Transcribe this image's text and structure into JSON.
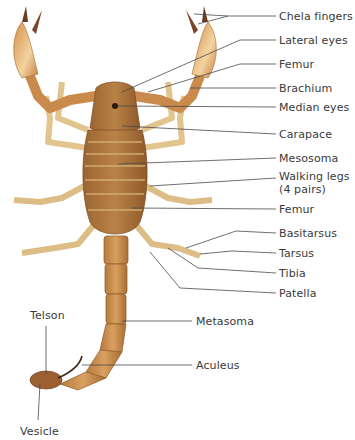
{
  "diagram": {
    "colors": {
      "body_dark": "#8a5a2b",
      "body_mid": "#b07a3e",
      "body_light": "#d9a866",
      "leg_light": "#e8cf9c",
      "claw_pale": "#f3d9a8",
      "claw_tip": "#6b3a22",
      "leader_line": "#4a4a4a",
      "label_text": "#3a3a3a"
    },
    "labels": [
      {
        "id": "chela-fingers",
        "text": "Chela fingers",
        "x": 279,
        "y": 11
      },
      {
        "id": "lateral-eyes",
        "text": "Lateral eyes",
        "x": 279,
        "y": 35
      },
      {
        "id": "femur-upper",
        "text": "Femur",
        "x": 279,
        "y": 60
      },
      {
        "id": "brachium",
        "text": "Brachium",
        "x": 279,
        "y": 84
      },
      {
        "id": "median-eyes",
        "text": "Median eyes",
        "x": 279,
        "y": 103
      },
      {
        "id": "carapace",
        "text": "Carapace",
        "x": 279,
        "y": 130
      },
      {
        "id": "mesosoma",
        "text": "Mesosoma",
        "x": 279,
        "y": 154
      },
      {
        "id": "walking-legs",
        "text": "Walking legs",
        "x": 279,
        "y": 172
      },
      {
        "id": "walking-legs-count",
        "text": "(4 pairs)",
        "x": 279,
        "y": 185
      },
      {
        "id": "femur-lower",
        "text": "Femur",
        "x": 279,
        "y": 205
      },
      {
        "id": "basitarsus",
        "text": "Basitarsus",
        "x": 279,
        "y": 229
      },
      {
        "id": "tarsus",
        "text": "Tarsus",
        "x": 279,
        "y": 249
      },
      {
        "id": "tibia",
        "text": "Tibia",
        "x": 279,
        "y": 269
      },
      {
        "id": "patella",
        "text": "Patella",
        "x": 279,
        "y": 289
      },
      {
        "id": "metasoma",
        "text": "Metasoma",
        "x": 196,
        "y": 317
      },
      {
        "id": "aculeus",
        "text": "Aculeus",
        "x": 196,
        "y": 361
      },
      {
        "id": "telson",
        "text": "Telson",
        "x": 33,
        "y": 311
      },
      {
        "id": "vesicle",
        "text": "Vesicle",
        "x": 23,
        "y": 427
      }
    ]
  }
}
